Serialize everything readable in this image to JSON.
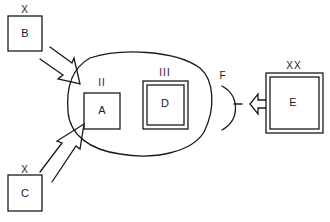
{
  "diagram": {
    "type": "block-diagram",
    "stroke_color": "#1a1a1a",
    "background": "#ffffff",
    "nodes": {
      "B": {
        "label": "B",
        "tag": "X",
        "style": "single-box"
      },
      "C": {
        "label": "C",
        "tag": "X",
        "style": "single-box"
      },
      "A": {
        "label": "A",
        "tag": "II",
        "style": "single-box"
      },
      "D": {
        "label": "D",
        "tag": "III",
        "style": "double-box"
      },
      "E": {
        "label": "E",
        "tag": "XX",
        "style": "double-box"
      },
      "F": {
        "label": "F",
        "style": "arc-receptor"
      }
    },
    "container": {
      "name": "enclosure",
      "contains": [
        "A",
        "D"
      ]
    },
    "edges": [
      {
        "from": "B",
        "to": "enclosure",
        "style": "hollow-arrow"
      },
      {
        "from": "C",
        "to": "enclosure",
        "style": "hollow-arrow"
      },
      {
        "from": "E",
        "to": "F",
        "style": "hollow-arrow"
      }
    ]
  }
}
